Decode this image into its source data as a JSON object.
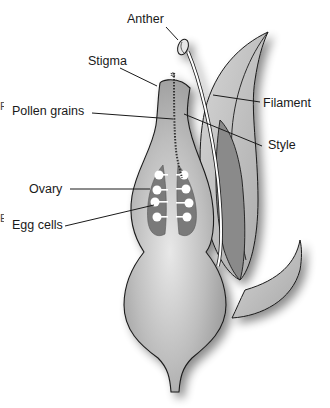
{
  "diagram": {
    "labels": {
      "anther": "Anther",
      "stigma": "Stigma",
      "pollen_grains": "Pollen grains",
      "filament": "Filament",
      "style": "Style",
      "ovary": "Ovary",
      "egg_cells": "Egg cells"
    },
    "edge_fragments": [
      "P",
      "E"
    ],
    "colors": {
      "outline": "#1a1a1a",
      "pistil_fill": "#b8b8b8",
      "ovary_chamber": "#7a7a7a",
      "petal_light": "#c4c4c4",
      "petal_dark": "#8a8a8a",
      "egg_cell": "#ffffff",
      "filament": "#ffffff"
    }
  }
}
